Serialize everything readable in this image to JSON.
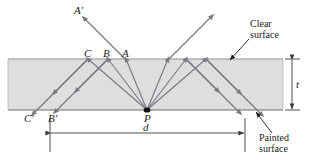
{
  "figure": {
    "width": 313,
    "height": 160,
    "background_color": "#ffffff",
    "slab": {
      "fill_color": "#dedede",
      "edge_color": "#8c8c8c",
      "x": 8,
      "y": 58,
      "width": 275,
      "height": 52
    },
    "ray_color": "#7a7a85",
    "label_color": "#1a1a1a"
  },
  "labels": {
    "a_prime": "A′",
    "a": "A",
    "b": "B",
    "c": "C",
    "b_prime": "B′",
    "c_prime": "C′",
    "p": "P",
    "thickness": "t",
    "distance": "d"
  },
  "annotations": {
    "clear_surface": {
      "line1": "Clear",
      "line2": "surface"
    },
    "painted_surface": {
      "line1": "Painted",
      "line2": "surface"
    }
  },
  "geometry": {
    "point_p": {
      "x": 147,
      "y": 110
    },
    "top_surface_y": 59,
    "bottom_surface_y": 110,
    "exit_points_top": [
      {
        "name": "A",
        "x": 126,
        "y": 59
      },
      {
        "name": "B",
        "x": 108,
        "y": 59
      },
      {
        "name": "C",
        "x": 88,
        "y": 59
      }
    ],
    "bottom_points": [
      {
        "name": "B′",
        "x": 55,
        "y": 110
      },
      {
        "name": "C′",
        "x": 33,
        "y": 110
      }
    ],
    "dimension_d": {
      "x1": 50,
      "x2": 245,
      "y": 133
    },
    "dimension_t": {
      "x": 292,
      "y1": 59,
      "y2": 110
    }
  }
}
